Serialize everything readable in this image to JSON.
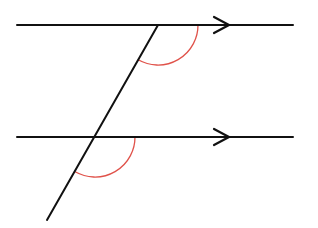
{
  "diagram": {
    "colors": {
      "line": "#111111",
      "angle_arc": "#e0524a",
      "background": "#ffffff"
    },
    "parallel_lines": [
      {
        "id": "top",
        "x1": 17,
        "y": 25,
        "x2": 293,
        "arrow_tip_x": 229
      },
      {
        "id": "bottom",
        "x1": 17,
        "y": 137,
        "x2": 293,
        "arrow_tip_x": 229
      }
    ],
    "transversal": {
      "x1": 158,
      "y1": 25,
      "x2": 47,
      "y2": 220
    },
    "angle_marks": [
      {
        "id": "upper-angle",
        "cx": 158,
        "cy": 25,
        "r": 40
      },
      {
        "id": "lower-angle",
        "cx": 95,
        "cy": 137,
        "r": 40
      }
    ]
  }
}
